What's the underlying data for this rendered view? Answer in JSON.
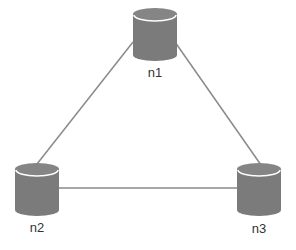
{
  "diagram": {
    "type": "network-topology",
    "colors": {
      "edge": "#8a8a8a",
      "node_body": "#7b7b7b",
      "node_top": "#858585",
      "node_highlight": "#ffffff",
      "label": "#333333"
    },
    "nodes": [
      {
        "id": "n1",
        "label": "n1",
        "cx": 155,
        "top": 8,
        "width": 44,
        "height": 53,
        "label_y": 66
      },
      {
        "id": "n2",
        "label": "n2",
        "cx": 37,
        "top": 163,
        "width": 44,
        "height": 53,
        "label_y": 221
      },
      {
        "id": "n3",
        "label": "n3",
        "cx": 259,
        "top": 163,
        "width": 44,
        "height": 53,
        "label_y": 222
      }
    ],
    "edges": [
      {
        "from": "n1",
        "to": "n2",
        "x1": 133,
        "y1": 42,
        "x2": 37,
        "y2": 164
      },
      {
        "from": "n1",
        "to": "n3",
        "x1": 175,
        "y1": 42,
        "x2": 261,
        "y2": 165
      },
      {
        "from": "n2",
        "to": "n3",
        "x1": 59,
        "y1": 188,
        "x2": 238,
        "y2": 188
      }
    ]
  }
}
